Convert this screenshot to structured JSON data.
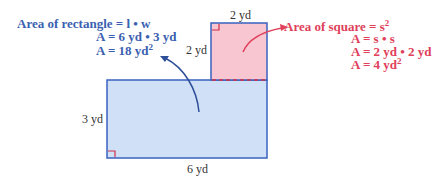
{
  "rectangle": {
    "label_width": "6 yd",
    "label_height": "3 yd",
    "fill": "#cfe0f7",
    "stroke": "#3a62c0",
    "formula": {
      "line1": "Area of rectangle = l • w",
      "line2": "A = 6 yd • 3 yd",
      "line3": "A = 18 yd",
      "line3_sup": "2"
    }
  },
  "square": {
    "label_top": "2 yd",
    "label_left": "2 yd",
    "fill": "#f7c6d0",
    "stroke": "#3a62c0",
    "formula": {
      "line1": "Area of square = s",
      "line1_sup": "2",
      "line2": "A = s • s",
      "line3": "A = 2 yd • 2 yd",
      "line4": "A = 4 yd",
      "line4_sup": "2"
    }
  },
  "colors": {
    "blue_text": "#3a5fb0",
    "red_text": "#e0405a",
    "right_angle_marker": "#d0304a"
  }
}
